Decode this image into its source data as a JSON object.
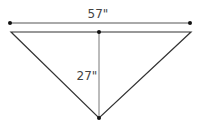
{
  "diagram": {
    "type": "triangle-dimension",
    "width_label": "57\"",
    "height_label": "27\"",
    "colors": {
      "line": "#333333",
      "dot": "#111111",
      "text": "#444444"
    }
  }
}
